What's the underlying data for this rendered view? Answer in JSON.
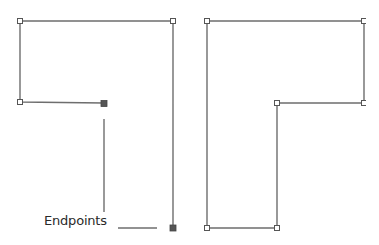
{
  "diagram": {
    "annotation": {
      "label": "Endpoints"
    },
    "colors": {
      "stroke": "#6e6e6e",
      "open_anchor_fill": "#ffffff",
      "endpoint_fill": "#555555",
      "text": "#2a2a2a"
    },
    "left_path": {
      "description": "Open path with two filled endpoints",
      "points": [
        [
          104,
          103
        ],
        [
          20,
          102
        ],
        [
          20,
          21
        ],
        [
          173,
          21
        ],
        [
          173,
          228
        ]
      ],
      "anchors": [
        [
          20,
          21
        ],
        [
          173,
          21
        ],
        [
          20,
          102
        ]
      ],
      "endpoints": [
        [
          104,
          103
        ],
        [
          173,
          228
        ]
      ]
    },
    "right_path": {
      "description": "Closed path, all open anchors",
      "points": [
        [
          207,
          21
        ],
        [
          364,
          21
        ],
        [
          364,
          103
        ],
        [
          277,
          103
        ],
        [
          277,
          228
        ],
        [
          207,
          228
        ]
      ],
      "anchors": [
        [
          207,
          21
        ],
        [
          277,
          103
        ],
        [
          207,
          228
        ],
        [
          277,
          228
        ]
      ],
      "clipped_anchors": [
        [
          364,
          21
        ],
        [
          364,
          103
        ]
      ]
    }
  }
}
